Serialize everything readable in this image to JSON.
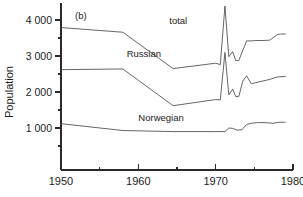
{
  "chart_data": {
    "type": "line",
    "title": "",
    "panel_label": "(b)",
    "xlabel": "",
    "ylabel": "Population",
    "xlim": [
      1950,
      1980
    ],
    "ylim": [
      0,
      4000
    ],
    "grid": false,
    "legend_position": "inline-labels",
    "x_ticks": [
      1950,
      1960,
      1970,
      1980
    ],
    "x_tick_labels": [
      "1950",
      "1960",
      "1970",
      "1980"
    ],
    "x_minor_ticks": [
      1955,
      1965,
      1975
    ],
    "y_ticks": [
      1000,
      2000,
      3000,
      4000
    ],
    "y_tick_labels": [
      "1 000",
      "2 000",
      "3 000",
      "4 000"
    ],
    "y_minor_ticks": [
      500,
      1500,
      2500,
      3500
    ],
    "series": [
      {
        "name": "total",
        "label": "total",
        "label_x": 1964.0,
        "label_y": 3900,
        "x": [
          1950,
          1958,
          1964.5,
          1970,
          1970.6,
          1971.2,
          1971.7,
          1972.2,
          1972.6,
          1973.0,
          1973.5,
          1974.0,
          1974.6,
          1975.2,
          1976.0,
          1977.0,
          1978.0,
          1978.4,
          1979.0
        ],
        "values": [
          3790,
          3660,
          2650,
          2800,
          2760,
          4390,
          2980,
          3120,
          2870,
          2880,
          3150,
          3420,
          3420,
          3430,
          3430,
          3440,
          3600,
          3610,
          3610
        ]
      },
      {
        "name": "Russian",
        "label": "Russian",
        "label_x": 1958.5,
        "label_y": 2960,
        "x": [
          1950,
          1958,
          1964.5,
          1970,
          1970.6,
          1971.2,
          1971.7,
          1972.2,
          1972.6,
          1973.0,
          1973.5,
          1974.0,
          1974.6,
          1975.2,
          1976.0,
          1977.0,
          1978.0,
          1979.0
        ],
        "values": [
          2620,
          2640,
          1620,
          1790,
          1780,
          3100,
          1920,
          2080,
          1870,
          1880,
          2300,
          2450,
          2230,
          2260,
          2300,
          2350,
          2420,
          2430
        ]
      },
      {
        "name": "Norwegian",
        "label": "Norwegian",
        "label_x": 1960.0,
        "label_y": 1190,
        "x": [
          1950,
          1958,
          1964.5,
          1970,
          1971.2,
          1971.7,
          1972.2,
          1972.8,
          1973.4,
          1974.0,
          1974.6,
          1975.4,
          1976.4,
          1977.4,
          1978.2,
          1979.0
        ],
        "values": [
          1120,
          930,
          900,
          900,
          900,
          1000,
          990,
          940,
          950,
          1100,
          1130,
          1150,
          1150,
          1130,
          1160,
          1160
        ]
      }
    ]
  }
}
